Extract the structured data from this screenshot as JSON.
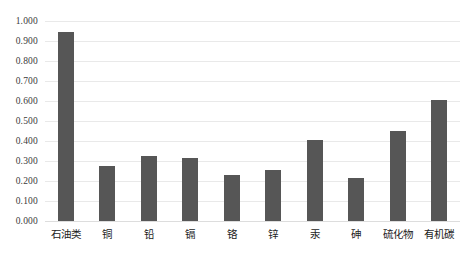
{
  "chart_data": {
    "type": "bar",
    "title": "",
    "subtitle": "",
    "xlabel": "",
    "ylabel": "",
    "categories": [
      "石油类",
      "铜",
      "铅",
      "镉",
      "铬",
      "锌",
      "汞",
      "砷",
      "硫化物",
      "有机碳"
    ],
    "values": [
      0.945,
      0.277,
      0.325,
      0.315,
      0.23,
      0.256,
      0.405,
      0.215,
      0.45,
      0.605
    ],
    "series": [
      {
        "name": "",
        "values": [
          0.945,
          0.277,
          0.325,
          0.315,
          0.23,
          0.256,
          0.405,
          0.215,
          0.45,
          0.605
        ]
      }
    ],
    "ylim": [
      0.0,
      1.0
    ],
    "ytick_values": [
      0.0,
      0.1,
      0.2,
      0.3,
      0.4,
      0.5,
      0.6,
      0.7,
      0.8,
      0.9,
      1.0
    ],
    "ytick_labels": [
      "0.000",
      "0.100",
      "0.200",
      "0.300",
      "0.400",
      "0.500",
      "0.600",
      "0.700",
      "0.800",
      "0.900",
      "1.000"
    ],
    "grid": "horizontal",
    "legend": "none",
    "annotations": [],
    "colors": {
      "bar": "#565656",
      "grid": "#e9e9e9",
      "axis": "#dddddd",
      "background": "#ffffff",
      "tick_text": "#3a3a3a",
      "category_text": "#1c1c1c"
    }
  }
}
